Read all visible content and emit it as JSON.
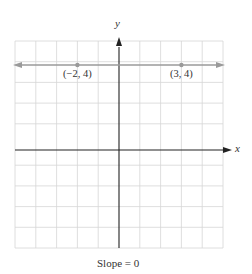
{
  "diagram": {
    "type": "coordinate-plane",
    "x_axis_label": "x",
    "y_axis_label": "y",
    "grid": {
      "x_min": -5,
      "x_max": 5,
      "y_min": -5,
      "y_max": 5,
      "step": 1
    },
    "line": {
      "description": "horizontal line y = 4",
      "color": "#9a9a9a"
    },
    "points": [
      {
        "x": -2,
        "y": 4,
        "label": "(−2, 4)"
      },
      {
        "x": 3,
        "y": 4,
        "label": "(3, 4)"
      }
    ],
    "caption": "Slope = 0",
    "colors": {
      "grid": "#d4d4d4",
      "axis": "#222222",
      "line": "#9a9a9a",
      "point": "#9a9a9a"
    }
  }
}
